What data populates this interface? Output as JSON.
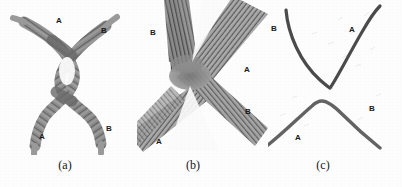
{
  "figure": {
    "background_color": "#fdfdfd",
    "strand_dark_color": "#4a4a4a",
    "strand_mid_color": "#6e6e6e",
    "strand_light_color": "#8e8e8e",
    "line_color": "#4b4b4b",
    "label_color": "#1b1b1b"
  },
  "panels": [
    {
      "id": "a",
      "caption": "(a)",
      "description": "two intertwined fibrous strands forming an interlocked loop",
      "labels": [
        {
          "text": "A",
          "x": 56,
          "y": 17
        },
        {
          "text": "B",
          "x": 101,
          "y": 27
        },
        {
          "text": "A",
          "x": 39,
          "y": 133
        },
        {
          "text": "B",
          "x": 106,
          "y": 125
        }
      ]
    },
    {
      "id": "b",
      "caption": "(b)",
      "description": "close-up of crossed fiber bundles meeting at a central node",
      "labels": [
        {
          "text": "B",
          "x": 150,
          "y": 29
        },
        {
          "text": "A",
          "x": 244,
          "y": 66
        },
        {
          "text": "B",
          "x": 245,
          "y": 108
        },
        {
          "text": "A",
          "x": 156,
          "y": 138
        }
      ]
    },
    {
      "id": "c",
      "caption": "(c)",
      "description": "two separated bent filaments, an upper V and a lower inverted V",
      "labels": [
        {
          "text": "B",
          "x": 271,
          "y": 25
        },
        {
          "text": "A",
          "x": 349,
          "y": 26
        },
        {
          "text": "A",
          "x": 295,
          "y": 134
        },
        {
          "text": "B",
          "x": 369,
          "y": 105
        }
      ]
    }
  ]
}
